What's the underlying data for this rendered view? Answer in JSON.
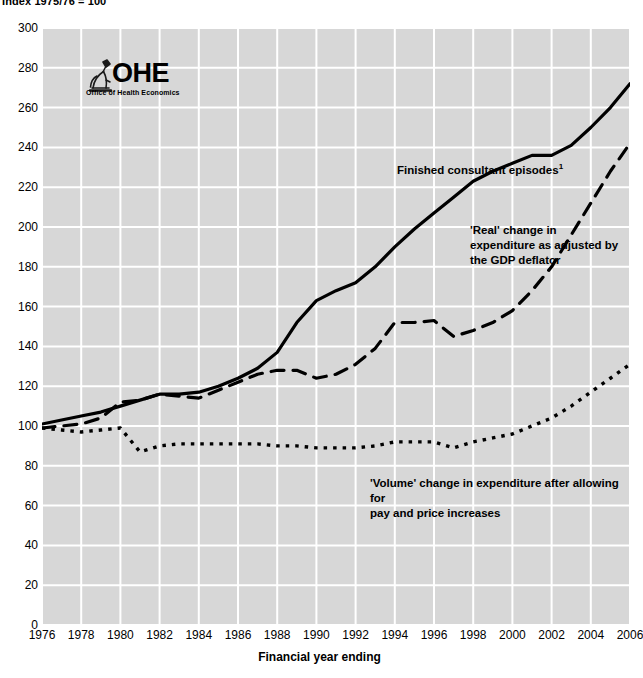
{
  "caption": {
    "index_note": "Index 1975/76 = 100"
  },
  "logo": {
    "name": "ohe-logo",
    "wordmark": "OHE",
    "subtitle": "Office of Health Economics",
    "icon": "microscope-icon"
  },
  "chart_data": {
    "type": "line",
    "title": "Index 1975/76 = 100",
    "xlabel": "Financial year ending",
    "ylabel": "",
    "xlim": [
      1976,
      2006
    ],
    "ylim": [
      0,
      300
    ],
    "grid": true,
    "legend": "annotations-inline",
    "x": [
      1976,
      1977,
      1978,
      1979,
      1980,
      1981,
      1982,
      1983,
      1984,
      1985,
      1986,
      1987,
      1988,
      1989,
      1990,
      1991,
      1992,
      1993,
      1994,
      1995,
      1996,
      1997,
      1998,
      1999,
      2000,
      2001,
      2002,
      2003,
      2004,
      2005,
      2006
    ],
    "xticks": [
      1976,
      1978,
      1980,
      1982,
      1984,
      1986,
      1988,
      1990,
      1992,
      1994,
      1996,
      1998,
      2000,
      2002,
      2004,
      2006
    ],
    "yticks": [
      0,
      20,
      40,
      60,
      80,
      100,
      120,
      140,
      160,
      180,
      200,
      220,
      240,
      260,
      280,
      300
    ],
    "series": [
      {
        "name": "Finished consultant episodes",
        "label": "Finished consultant episodes¹",
        "style": "solid",
        "color": "#000000",
        "values": [
          101,
          103,
          105,
          107,
          110,
          113,
          116,
          116,
          117,
          120,
          124,
          129,
          137,
          152,
          163,
          168,
          172,
          180,
          190,
          199,
          207,
          215,
          223,
          228,
          232,
          236,
          236,
          241,
          250,
          260,
          272
        ]
      },
      {
        "name": "'Real' change in expenditure as adjusted by the GDP deflator",
        "label": "'Real' change in\nexpenditure as adjusted by\nthe GDP deflator",
        "style": "dashed",
        "color": "#000000",
        "values": [
          99,
          100,
          101,
          104,
          112,
          113,
          116,
          115,
          114,
          118,
          122,
          126,
          128,
          128,
          124,
          126,
          131,
          139,
          152,
          152,
          153,
          145,
          148,
          152,
          158,
          168,
          180,
          196,
          212,
          228,
          242
        ]
      },
      {
        "name": "'Volume' change in expenditure after allowing for pay and price increases",
        "label": "'Volume' change in expenditure after allowing for\npay and price increases",
        "style": "dotted",
        "color": "#000000",
        "values": [
          99,
          98,
          97,
          98,
          99,
          87,
          90,
          91,
          91,
          91,
          91,
          91,
          90,
          90,
          89,
          89,
          89,
          90,
          92,
          92,
          92,
          89,
          92,
          94,
          96,
          100,
          104,
          110,
          117,
          124,
          131
        ]
      }
    ],
    "annotations": [
      {
        "id": "fce",
        "text": "Finished consultant episodes¹"
      },
      {
        "id": "real",
        "text": "'Real' change in\nexpenditure as adjusted by\nthe GDP deflator"
      },
      {
        "id": "volume",
        "text": "'Volume' change in expenditure after allowing for\npay and price increases"
      }
    ],
    "colors": {
      "plot_background": "#d7d7d7",
      "gridline": "#ffffff",
      "line": "#000000",
      "page_background": "#ffffff"
    }
  },
  "x_axis": {
    "title": "Financial year ending",
    "labels": [
      "1976",
      "1978",
      "1980",
      "1982",
      "1984",
      "1986",
      "1988",
      "1990",
      "1992",
      "1994",
      "1996",
      "1998",
      "2000",
      "2002",
      "2004",
      "2006"
    ]
  },
  "y_axis": {
    "labels": [
      "300",
      "280",
      "260",
      "240",
      "220",
      "200",
      "180",
      "160",
      "140",
      "120",
      "100",
      "80",
      "60",
      "40",
      "20",
      "0"
    ]
  },
  "annotations": {
    "fce_main": "Finished consultant episodes",
    "fce_sup": "1",
    "real": "'Real' change in\nexpenditure as adjusted by\nthe GDP deflator",
    "volume": "'Volume' change in expenditure after allowing for\npay and price increases"
  }
}
